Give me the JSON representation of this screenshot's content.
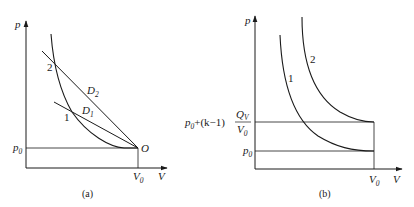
{
  "figure_a": {
    "caption": "(a)",
    "axis_y_label": "p",
    "axis_x_label": "V",
    "p0_label": "p",
    "p0_sub": "0",
    "v0_label": "V",
    "v0_sub": "0",
    "origin_label": "O",
    "point_1": "1",
    "point_2": "2",
    "line_d1_label": "D",
    "line_d1_sub": "1",
    "line_d2_label": "D",
    "line_d2_sub": "2"
  },
  "figure_b": {
    "caption": "(b)",
    "axis_y_label": "p",
    "axis_x_label": "V",
    "upper_level_prefix": "p",
    "upper_level_prefix_sub": "0",
    "upper_level_mid": "+(k−1)",
    "upper_level_num": "Q",
    "upper_level_num_sub": "V",
    "upper_level_den": "V",
    "upper_level_den_sub": "0",
    "p0_label": "p",
    "p0_sub": "0",
    "v0_label": "V",
    "v0_sub": "0",
    "curve_1": "1",
    "curve_2": "2"
  },
  "colors": {
    "ink": "#1a1a1a",
    "background": "#ffffff"
  }
}
